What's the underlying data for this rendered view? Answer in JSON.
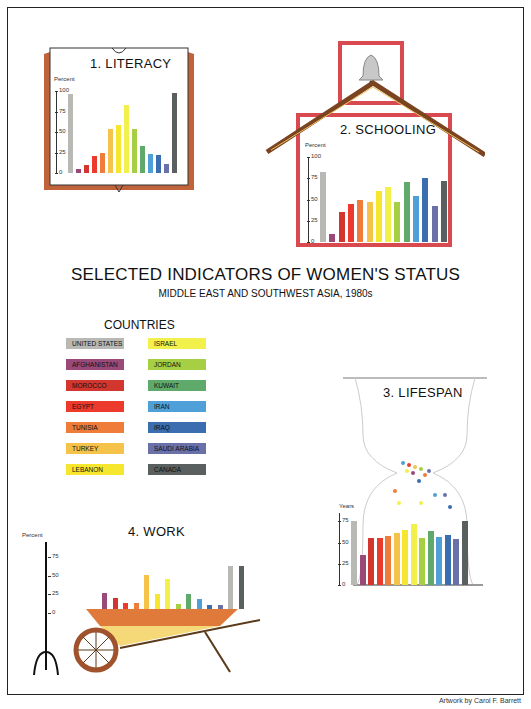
{
  "title": "SELECTED INDICATORS OF WOMEN'S STATUS",
  "subtitle": "MIDDLE EAST AND SOUTHWEST ASIA, 1980s",
  "credit": "Artwork by Carol F. Barrett",
  "legend": {
    "title": "COUNTRIES",
    "items": [
      {
        "label": "UNITED STATES",
        "color": "#b8b8b4"
      },
      {
        "label": "AFGHANISTAN",
        "color": "#9a4a78"
      },
      {
        "label": "MOROCCO",
        "color": "#d2362e"
      },
      {
        "label": "EGYPT",
        "color": "#ec3a2c"
      },
      {
        "label": "TUNISIA",
        "color": "#f07c3a"
      },
      {
        "label": "TURKEY",
        "color": "#f5c34a"
      },
      {
        "label": "LEBANON",
        "color": "#f7e62e"
      },
      {
        "label": "ISRAEL",
        "color": "#f2f04a"
      },
      {
        "label": "JORDAN",
        "color": "#a6cf44"
      },
      {
        "label": "KUWAIT",
        "color": "#5faa6a"
      },
      {
        "label": "IRAN",
        "color": "#4fa0d8"
      },
      {
        "label": "IRAQ",
        "color": "#3a6eb0"
      },
      {
        "label": "SAUDI ARABIA",
        "color": "#6a70a8"
      },
      {
        "label": "CANADA",
        "color": "#5a6060"
      }
    ]
  },
  "chart_data": [
    {
      "type": "bar",
      "title": "1. LITERACY",
      "ylabel": "Percent",
      "yticks": [
        "100",
        "75",
        "50",
        "25",
        "0"
      ],
      "ylim": [
        0,
        100
      ],
      "categories": [
        "United States",
        "Afghanistan",
        "Morocco",
        "Egypt",
        "Tunisia",
        "Turkey",
        "Lebanon",
        "Israel",
        "Jordan",
        "Kuwait",
        "Iran",
        "Iraq",
        "Saudi Arabia",
        "Canada"
      ],
      "values": [
        96,
        5,
        10,
        21,
        24,
        54,
        58,
        83,
        54,
        33,
        23,
        22,
        11,
        97
      ]
    },
    {
      "type": "bar",
      "title": "2. SCHOOLING",
      "ylabel": "Percent",
      "yticks": [
        "100",
        "75",
        "50",
        "25",
        "0"
      ],
      "ylim": [
        0,
        100
      ],
      "categories": [
        "United States",
        "Afghanistan",
        "Morocco",
        "Egypt",
        "Tunisia",
        "Turkey",
        "Lebanon",
        "Israel",
        "Jordan",
        "Kuwait",
        "Iran",
        "Iraq",
        "Saudi Arabia",
        "Canada"
      ],
      "values": [
        82,
        9,
        35,
        45,
        50,
        47,
        60,
        65,
        47,
        71,
        54,
        75,
        42,
        72
      ]
    },
    {
      "type": "bar",
      "title": "3. LIFESPAN",
      "ylabel": "Years",
      "yticks": [
        "75",
        "50",
        "25",
        "0"
      ],
      "ylim": [
        0,
        85
      ],
      "categories": [
        "United States",
        "Afghanistan",
        "Morocco",
        "Egypt",
        "Tunisia",
        "Turkey",
        "Lebanon",
        "Israel",
        "Jordan",
        "Kuwait",
        "Iran",
        "Iraq",
        "Saudi Arabia",
        "Canada"
      ],
      "values": [
        76,
        35,
        56,
        55,
        58,
        61,
        65,
        72,
        55,
        64,
        57,
        59,
        54,
        76
      ]
    },
    {
      "type": "bar",
      "title": "4. WORK",
      "ylabel": "Percent",
      "yticks": [
        "75",
        "50",
        "25",
        "0"
      ],
      "ylim": [
        0,
        80
      ],
      "categories": [
        "Afghanistan",
        "Morocco",
        "Egypt",
        "Tunisia",
        "Turkey",
        "Lebanon",
        "Israel",
        "Jordan",
        "Kuwait",
        "Iran",
        "Iraq",
        "Saudi Arabia",
        "United States",
        "Canada"
      ],
      "values": [
        22,
        15,
        8,
        8,
        45,
        20,
        40,
        7,
        20,
        14,
        5,
        6,
        57,
        57
      ]
    }
  ]
}
